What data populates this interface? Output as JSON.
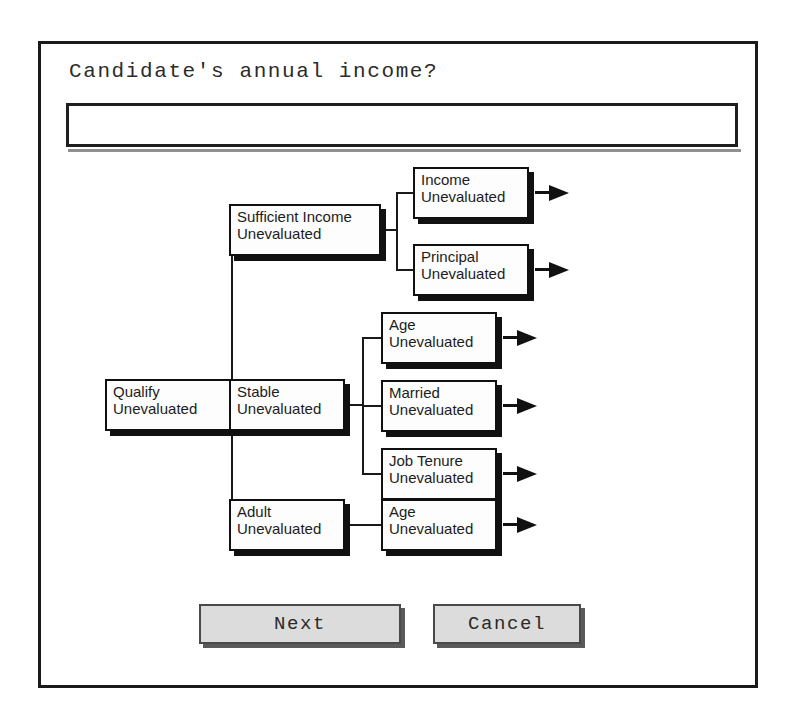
{
  "dialog": {
    "prompt": "Candidate's annual income?",
    "input": {
      "value": "",
      "placeholder": ""
    },
    "buttons": {
      "next": "Next",
      "cancel": "Cancel"
    }
  },
  "colors": {
    "background": "#ffffff",
    "border": "#1a1a1a",
    "node_fill": "#fdfdfd",
    "node_shadow": "#111111",
    "button_face": "#dcdcdc",
    "text": "#1c1c1c"
  },
  "tree": {
    "state_label": "Unevaluated",
    "nodes": [
      {
        "id": "qualify",
        "title": "Qualify",
        "state": "Unevaluated",
        "x": 64,
        "y": 335,
        "w": 130,
        "h": 52,
        "arrow": false
      },
      {
        "id": "sufficient-income",
        "title": "Sufficient Income",
        "state": "Unevaluated",
        "x": 188,
        "y": 160,
        "w": 152,
        "h": 52,
        "arrow": false
      },
      {
        "id": "stable",
        "title": "Stable",
        "state": "Unevaluated",
        "x": 188,
        "y": 335,
        "w": 116,
        "h": 52,
        "arrow": false
      },
      {
        "id": "adult",
        "title": "Adult",
        "state": "Unevaluated",
        "x": 188,
        "y": 455,
        "w": 116,
        "h": 52,
        "arrow": false
      },
      {
        "id": "income",
        "title": "Income",
        "state": "Unevaluated",
        "x": 372,
        "y": 123,
        "w": 116,
        "h": 52,
        "arrow": true
      },
      {
        "id": "principal",
        "title": "Principal",
        "state": "Unevaluated",
        "x": 372,
        "y": 200,
        "w": 116,
        "h": 52,
        "arrow": true
      },
      {
        "id": "age-stable",
        "title": "Age",
        "state": "Unevaluated",
        "x": 340,
        "y": 268,
        "w": 116,
        "h": 52,
        "arrow": true
      },
      {
        "id": "married",
        "title": "Married",
        "state": "Unevaluated",
        "x": 340,
        "y": 336,
        "w": 116,
        "h": 52,
        "arrow": true
      },
      {
        "id": "job-tenure",
        "title": "Job Tenure",
        "state": "Unevaluated",
        "x": 340,
        "y": 404,
        "w": 116,
        "h": 52,
        "arrow": true
      },
      {
        "id": "age-adult",
        "title": "Age",
        "state": "Unevaluated",
        "x": 340,
        "y": 455,
        "w": 116,
        "h": 52,
        "arrow": true
      }
    ],
    "edges": [
      {
        "from": "qualify",
        "to": "sufficient-income"
      },
      {
        "from": "qualify",
        "to": "stable"
      },
      {
        "from": "qualify",
        "to": "adult"
      },
      {
        "from": "sufficient-income",
        "to": "income"
      },
      {
        "from": "sufficient-income",
        "to": "principal"
      },
      {
        "from": "stable",
        "to": "age-stable"
      },
      {
        "from": "stable",
        "to": "married"
      },
      {
        "from": "stable",
        "to": "job-tenure"
      },
      {
        "from": "adult",
        "to": "age-adult"
      }
    ]
  }
}
